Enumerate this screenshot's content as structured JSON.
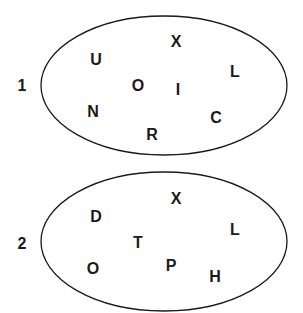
{
  "sets": [
    {
      "label": "1",
      "label_pos": [
        22,
        85
      ],
      "ellipse": {
        "cx": 164,
        "cy": 85.5,
        "rx": 123,
        "ry": 69.5
      },
      "letters": [
        {
          "char": "X",
          "x": 176,
          "y": 41
        },
        {
          "char": "U",
          "x": 96,
          "y": 59
        },
        {
          "char": "L",
          "x": 235,
          "y": 71
        },
        {
          "char": "O",
          "x": 138,
          "y": 85
        },
        {
          "char": "I",
          "x": 178,
          "y": 89
        },
        {
          "char": "N",
          "x": 93,
          "y": 111
        },
        {
          "char": "C",
          "x": 216,
          "y": 117
        },
        {
          "char": "R",
          "x": 152,
          "y": 134
        }
      ]
    },
    {
      "label": "2",
      "label_pos": [
        22,
        243
      ],
      "ellipse": {
        "cx": 164,
        "cy": 241.5,
        "rx": 123,
        "ry": 69.5
      },
      "letters": [
        {
          "char": "X",
          "x": 176,
          "y": 198
        },
        {
          "char": "D",
          "x": 96,
          "y": 216
        },
        {
          "char": "L",
          "x": 235,
          "y": 229
        },
        {
          "char": "T",
          "x": 138,
          "y": 242
        },
        {
          "char": "O",
          "x": 93,
          "y": 268
        },
        {
          "char": "P",
          "x": 171,
          "y": 265
        },
        {
          "char": "H",
          "x": 215,
          "y": 276
        }
      ]
    }
  ],
  "colors": {
    "stroke": "#1a1a1a",
    "text": "#1a1a1a",
    "background": "#ffffff"
  }
}
